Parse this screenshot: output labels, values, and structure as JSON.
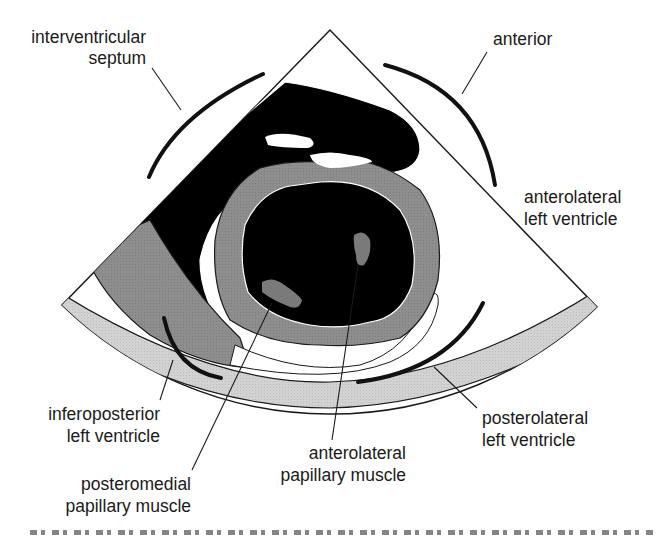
{
  "figure": {
    "colors": {
      "blood_pool": "#000000",
      "myocardium": "#8c8c8c",
      "pericardium_band": "#cfcfcf",
      "right_ventricle_wall": "#8c8c8c",
      "sector_outline": "#1a1a1a",
      "background": "#ffffff",
      "papillary_muscle": "#7a7a7a"
    },
    "labels": {
      "interventricular_septum": [
        "interventricular",
        "septum"
      ],
      "anterior": [
        "anterior"
      ],
      "anterolateral_lv": [
        "anterolateral",
        "left ventricle"
      ],
      "inferoposterior_lv": [
        "inferoposterior",
        "left ventricle"
      ],
      "posterolateral_lv": [
        "posterolateral",
        "left ventricle"
      ],
      "posteromedial_pm": [
        "posteromedial",
        "papillary muscle"
      ],
      "anterolateral_pm": [
        "anterolateral",
        "papillary muscle"
      ]
    },
    "caption": {
      "visible": "cropped",
      "note": "bottom caption line cut off at frame edge"
    }
  }
}
